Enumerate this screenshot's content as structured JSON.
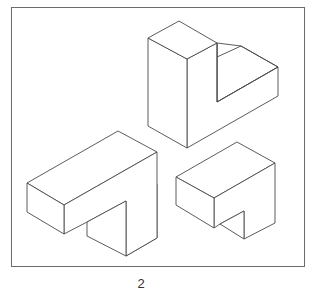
{
  "figure": {
    "caption": "2",
    "frame_color": "#6b6b6b",
    "line_color": "#4a4a4a",
    "shapes": [
      {
        "name": "upright-l-block",
        "description": "Tall rectangular block with an L-shaped arm extending to the right"
      },
      {
        "name": "long-t-block",
        "description": "Long horizontal bar with a downward leg at its right end"
      },
      {
        "name": "short-t-block",
        "description": "Short box with a small downward notch leg at its right end"
      }
    ]
  }
}
